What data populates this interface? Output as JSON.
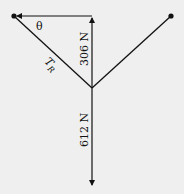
{
  "diagram": {
    "type": "force-diagram",
    "background": "#efefef",
    "stroke_color": "#111111",
    "labels": {
      "angle": "θ",
      "tension_main": "T",
      "tension_sub": "R",
      "vertical_component": "306 N",
      "weight": "612 N"
    },
    "points": {
      "left_anchor": [
        14,
        16
      ],
      "right_anchor": [
        171,
        16
      ],
      "junction": [
        92,
        88
      ],
      "vertical_top": [
        92,
        16
      ],
      "weight_tip": [
        92,
        185
      ]
    }
  }
}
